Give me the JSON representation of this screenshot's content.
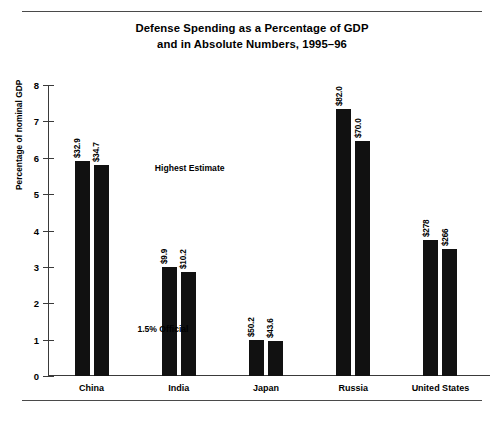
{
  "figure": {
    "title_line1": "Defense Spending as a Percentage of GDP",
    "title_line2": "and in Absolute Numbers, 1995–96"
  },
  "chart_data": {
    "type": "bar",
    "xlabel": "",
    "ylabel": "Percentage of nominal GDP",
    "ylim": [
      0,
      8
    ],
    "yticks": [
      "0",
      "1",
      "2",
      "3",
      "4",
      "5",
      "6",
      "7",
      "8"
    ],
    "grid": false,
    "legend": "none",
    "categories": [
      "China",
      "India",
      "Japan",
      "Russia",
      "United States"
    ],
    "series": [
      {
        "name": "1995",
        "values": [
          5.9,
          3.0,
          1.0,
          7.35,
          3.75
        ],
        "point_labels": [
          "$32.9",
          "$9.9",
          "$50.2",
          "$82.0",
          "$278"
        ]
      },
      {
        "name": "1996",
        "values": [
          5.8,
          2.85,
          0.95,
          6.45,
          3.5
        ],
        "point_labels": [
          "$34.7",
          "$10.2",
          "$43.6",
          "$70.0",
          "$266"
        ]
      }
    ],
    "annotations": [
      {
        "text": "Highest Estimate",
        "x_pct": 24.5,
        "y_value": 5.85
      },
      {
        "text": "1.5% Official",
        "x_pct": 20.5,
        "y_value": 1.42
      }
    ],
    "bar_color": "#111111"
  }
}
